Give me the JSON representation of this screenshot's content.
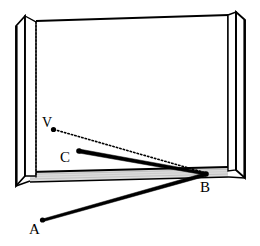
{
  "figure": {
    "background_color": "#ffffff",
    "stroke_color": "#000000",
    "shade_color": "#d8d8d8",
    "panel_fill": "#ffffff"
  },
  "labels": [
    {
      "id": "V",
      "text": "V",
      "x": 42,
      "y": 127,
      "point_x": 53,
      "point_y": 129
    },
    {
      "id": "C",
      "text": "C",
      "x": 60,
      "y": 162,
      "point_x": 79,
      "point_y": 151
    },
    {
      "id": "B",
      "text": "B",
      "x": 200,
      "y": 192,
      "point_x": 206,
      "point_y": 174
    },
    {
      "id": "A",
      "text": "A",
      "x": 29,
      "y": 234,
      "point_x": 42,
      "point_y": 220
    }
  ],
  "segments": [
    {
      "id": "V-B",
      "from": "V",
      "to": "B",
      "style": "dotted"
    },
    {
      "id": "C-B",
      "from": "C",
      "to": "B",
      "style": "solid"
    },
    {
      "id": "A-B",
      "from": "A",
      "to": "B",
      "style": "solid"
    }
  ],
  "box": {
    "back_panel": {
      "top_left_x": 24,
      "top_left_y": 17,
      "top_right_x": 228,
      "top_right_y": 13,
      "bottom_right_x": 228,
      "bottom_right_y": 170,
      "bottom_left_x": 24,
      "bottom_left_y": 175
    },
    "floor_strip": {
      "label": "shaded-floor-strip"
    },
    "left_flap": {
      "label": "left-side-panel"
    },
    "right_flap": {
      "label": "right-side-panel"
    },
    "hidden_edge": {
      "label": "dotted-hidden-vertical-edge",
      "x": 36
    }
  }
}
